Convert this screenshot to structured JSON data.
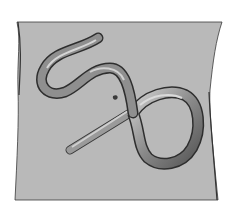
{
  "illustration": {
    "alt": "Medical illustration of an abdomen with a looped tubular structure forming an S-curve and a twisted loop near the navel",
    "colors": {
      "background": "#ffffff",
      "torso": "#b9b9b9",
      "outline": "#2a2a2a",
      "tube_light": "#c8c8c8",
      "tube_dark": "#5a5a5a"
    }
  }
}
